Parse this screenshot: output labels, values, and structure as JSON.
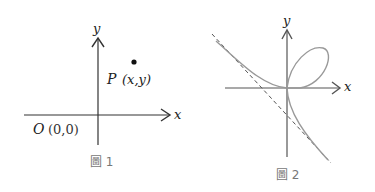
{
  "figure1": {
    "axis_x_label": "x",
    "axis_y_label": "y",
    "point_name": "P",
    "point_coords": "(x,y)",
    "origin_name": "O",
    "origin_coords": "(0,0)",
    "caption": "圖 1"
  },
  "figure2": {
    "axis_x_label": "x",
    "axis_y_label": "y",
    "caption": "圖 2",
    "curve": "folium-like curve with loop in first quadrant and dashed oblique asymptote"
  },
  "colors": {
    "axis": "#333333",
    "curve": "#999999",
    "asymptote": "#555555",
    "caption": "#777777"
  }
}
